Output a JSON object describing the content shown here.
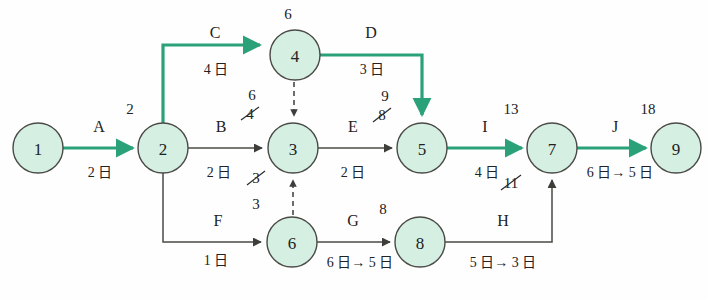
{
  "diagram": {
    "type": "activity-on-arrow-network",
    "colors": {
      "critical_path": "#2aa179",
      "normal_edge": "#5a5a55",
      "node_fill": "#d5efe2",
      "node_stroke": "#4a4a46",
      "text": "#2b2b2b",
      "background": "#fefefe"
    },
    "nodes": [
      {
        "id": "n1",
        "label": "1",
        "cx": 38,
        "cy": 148,
        "r": 25,
        "event_time": ""
      },
      {
        "id": "n2",
        "label": "2",
        "cx": 163,
        "cy": 148,
        "r": 25,
        "event_time": "2"
      },
      {
        "id": "n3",
        "label": "3",
        "cx": 293,
        "cy": 148,
        "r": 25,
        "event_time": "6",
        "event_time_struck": "4"
      },
      {
        "id": "n4",
        "label": "4",
        "cx": 295,
        "cy": 55,
        "r": 25,
        "event_time": "6"
      },
      {
        "id": "n5",
        "label": "5",
        "cx": 422,
        "cy": 148,
        "r": 25,
        "event_time": "9",
        "event_time_struck": "8"
      },
      {
        "id": "n6",
        "label": "6",
        "cx": 292,
        "cy": 242,
        "r": 25,
        "event_time": "3"
      },
      {
        "id": "n7",
        "label": "7",
        "cx": 552,
        "cy": 148,
        "r": 25,
        "event_time": "13",
        "event_time_struck": "11"
      },
      {
        "id": "n8",
        "label": "8",
        "cx": 420,
        "cy": 242,
        "r": 25,
        "event_time": "8"
      },
      {
        "id": "n9",
        "label": "9",
        "cx": 676,
        "cy": 148,
        "r": 25,
        "event_time": "18"
      }
    ],
    "edges": [
      {
        "id": "eA",
        "name": "A",
        "from": "1",
        "to": "2",
        "duration": "2 日",
        "critical": true
      },
      {
        "id": "eC",
        "name": "C",
        "from": "2",
        "to": "4",
        "duration": "4 日",
        "critical": true
      },
      {
        "id": "eD",
        "name": "D",
        "from": "4",
        "to": "5",
        "duration": "3 日",
        "critical": true
      },
      {
        "id": "eB",
        "name": "B",
        "from": "2",
        "to": "3",
        "duration": "2 日",
        "critical": false
      },
      {
        "id": "eE",
        "name": "E",
        "from": "3",
        "to": "5",
        "duration": "2 日",
        "critical": false
      },
      {
        "id": "eF",
        "name": "F",
        "from": "2",
        "to": "6",
        "duration": "1 日",
        "critical": false
      },
      {
        "id": "eG",
        "name": "G",
        "from": "6",
        "to": "8",
        "duration": "6 日→ 5 日",
        "critical": false
      },
      {
        "id": "eH",
        "name": "H",
        "from": "8",
        "to": "7",
        "duration": "5 日→ 3 日",
        "critical": false
      },
      {
        "id": "eI",
        "name": "I",
        "from": "5",
        "to": "7",
        "duration": "4 日",
        "critical": true
      },
      {
        "id": "eJ",
        "name": "J",
        "from": "7",
        "to": "9",
        "duration": "6 日→ 5 日",
        "critical": true
      }
    ],
    "dummy_edges": [
      {
        "id": "d43",
        "from": "4",
        "to": "3",
        "style": "dashed"
      },
      {
        "id": "d63",
        "from": "6",
        "to": "3",
        "style": "dashed"
      }
    ],
    "labels": {
      "edge_A": "A",
      "edge_B": "B",
      "edge_C": "C",
      "edge_D": "D",
      "edge_E": "E",
      "edge_F": "F",
      "edge_G": "G",
      "edge_H": "H",
      "edge_I": "I",
      "edge_J": "J",
      "dur_A": "2 日",
      "dur_B": "2 日",
      "dur_C": "4 日",
      "dur_D": "3 日",
      "dur_E": "2 日",
      "dur_F": "1 日",
      "dur_G": "6 日→ 5 日",
      "dur_H": "5 日→ 3 日",
      "dur_I": "4 日",
      "dur_J": "6 日→ 5 日",
      "node_1": "1",
      "node_2": "2",
      "node_3": "3",
      "node_4": "4",
      "node_5": "5",
      "node_6": "6",
      "node_7": "7",
      "node_8": "8",
      "node_9": "9",
      "t_2": "2",
      "t_4": "6",
      "t_3_new": "6",
      "t_3_old": "4",
      "t_3_lower_old": "3",
      "t_3_lower_new": "3",
      "t_5_new": "9",
      "t_5_old": "8",
      "t_7_new": "13",
      "t_7_old": "11",
      "t_8": "8",
      "t_9": "18"
    }
  }
}
